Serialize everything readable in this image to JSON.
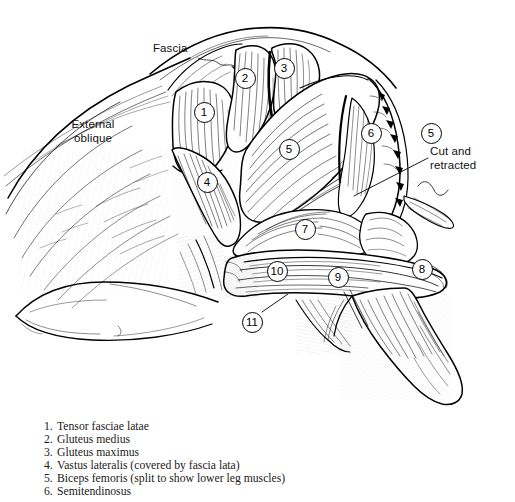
{
  "figure": {
    "medium": "pen-and-ink line drawing",
    "background_color": "#ffffff",
    "ink_color": "#000000"
  },
  "callouts": [
    {
      "name": "fascia",
      "text": "Fascia",
      "x": 153,
      "y": 42,
      "leader": "squiggle pointing down-right into fascia sheet"
    },
    {
      "name": "external-oblique",
      "text": "External\noblique",
      "x": 54,
      "y": 118,
      "leader": "none"
    },
    {
      "name": "cut-and-retracted",
      "text": "Cut and\nretracted",
      "x": 430,
      "y": 145,
      "leader": "straight line running down-left to the cut muscle flap"
    }
  ],
  "markers": [
    {
      "id": "marker-1",
      "label": "1",
      "x": 204,
      "y": 112,
      "leader": false
    },
    {
      "id": "marker-2",
      "label": "2",
      "x": 245,
      "y": 78,
      "leader": false
    },
    {
      "id": "marker-3",
      "label": "3",
      "x": 284,
      "y": 68,
      "leader": false
    },
    {
      "id": "marker-4",
      "label": "4",
      "x": 207,
      "y": 182,
      "leader": false
    },
    {
      "id": "marker-5a",
      "label": "5",
      "x": 289,
      "y": 149,
      "leader": false
    },
    {
      "id": "marker-6",
      "label": "6",
      "x": 371,
      "y": 133,
      "leader": false
    },
    {
      "id": "marker-5b",
      "label": "5",
      "x": 431,
      "y": 133,
      "leader": false
    },
    {
      "id": "marker-7",
      "label": "7",
      "x": 305,
      "y": 229,
      "leader": false
    },
    {
      "id": "marker-10",
      "label": "10",
      "x": 277,
      "y": 271,
      "leader": false
    },
    {
      "id": "marker-9",
      "label": "9",
      "x": 338,
      "y": 277,
      "leader": false
    },
    {
      "id": "marker-8",
      "label": "8",
      "x": 422,
      "y": 269,
      "leader": false
    },
    {
      "id": "marker-11",
      "label": "11",
      "x": 252,
      "y": 322,
      "leader": true
    }
  ],
  "legend": {
    "items": [
      {
        "number": "1.",
        "text": "Tensor fasciae latae"
      },
      {
        "number": "2.",
        "text": "Gluteus medius"
      },
      {
        "number": "3.",
        "text": "Gluteus maximus"
      },
      {
        "number": "4.",
        "text": "Vastus lateralis (covered by fascia lata)"
      },
      {
        "number": "5.",
        "text": "Biceps femoris (split to show lower leg muscles)"
      },
      {
        "number": "6.",
        "text": "Semitendinosus"
      }
    ]
  }
}
